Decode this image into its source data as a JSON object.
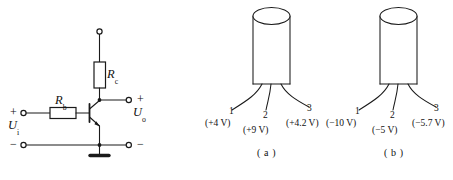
{
  "figure": {
    "type": "electronics-diagram",
    "background_color": "#ffffff",
    "ink_color": "#1a1a1a"
  },
  "circuit": {
    "name": "common-emitter-amplifier",
    "input_label": "U",
    "input_subscript": "i",
    "output_label": "U",
    "output_subscript": "o",
    "resistor_base_label": "R",
    "resistor_base_subscript": "b",
    "resistor_collector_label": "R",
    "resistor_collector_subscript": "c",
    "input_plus": "+",
    "input_minus": "−",
    "output_plus": "+",
    "output_minus": "−",
    "transistor_type": "NPN"
  },
  "packages": [
    {
      "id": "a",
      "caption": "( a )",
      "pins": [
        {
          "number": "1",
          "voltage": "(+4 V)"
        },
        {
          "number": "2",
          "voltage": "(+9 V)"
        },
        {
          "number": "3",
          "voltage": "(+4.2 V)"
        }
      ]
    },
    {
      "id": "b",
      "caption": "( b )",
      "pins": [
        {
          "number": "1",
          "voltage": "(−10 V)"
        },
        {
          "number": "2",
          "voltage": "(−5 V)"
        },
        {
          "number": "3",
          "voltage": "(−5.7 V)"
        }
      ]
    }
  ]
}
